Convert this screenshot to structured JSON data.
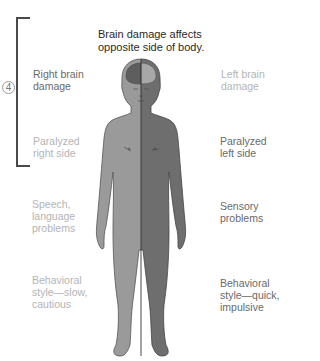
{
  "title": "Brain damage affects\nopposite side of body.",
  "step_marker": "4",
  "colors": {
    "right_side_shade": "#9a9a9a",
    "left_side_shade": "#6e6e6e",
    "bracket": "#4a4a4a",
    "text_emphasis": "#6a6a6a",
    "text_dim": "#b4b4b4"
  },
  "right_side_labels": [
    {
      "text": "Right brain\ndamage",
      "emphasis": true
    },
    {
      "text": "Paralyzed\nright side",
      "emphasis": false
    },
    {
      "text": "Speech,\nlanguage\nproblems",
      "emphasis": false
    },
    {
      "text": "Behavioral\nstyle—slow,\ncautious",
      "emphasis": false
    }
  ],
  "left_side_labels": [
    {
      "text": "Left brain\ndamage",
      "emphasis": false
    },
    {
      "text": "Paralyzed\nleft side",
      "emphasis": true
    },
    {
      "text": "Sensory\nproblems",
      "emphasis": true
    },
    {
      "text": "Behavioral\nstyle—quick,\nimpulsive",
      "emphasis": true
    }
  ]
}
